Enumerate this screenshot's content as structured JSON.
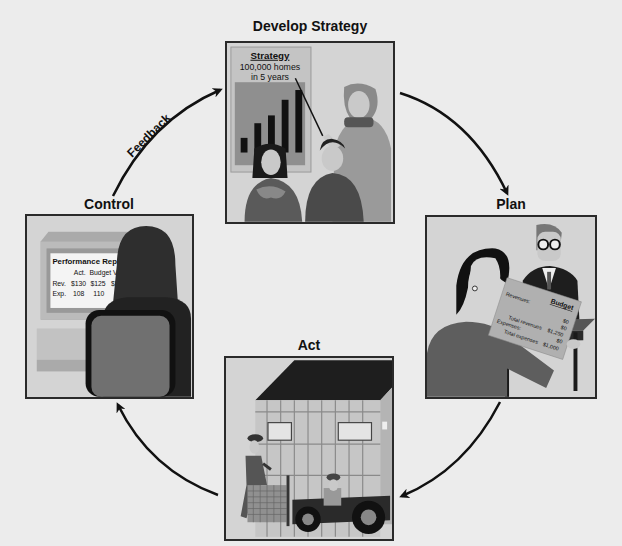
{
  "diagram": {
    "type": "cycle",
    "background_color": "#ececec",
    "stages": [
      {
        "id": "develop-strategy",
        "label": "Develop Strategy"
      },
      {
        "id": "plan",
        "label": "Plan"
      },
      {
        "id": "act",
        "label": "Act"
      },
      {
        "id": "control",
        "label": "Control"
      }
    ],
    "arrows": [
      {
        "from": "develop-strategy",
        "to": "plan",
        "label": ""
      },
      {
        "from": "plan",
        "to": "act",
        "label": ""
      },
      {
        "from": "act",
        "to": "control",
        "label": ""
      },
      {
        "from": "control",
        "to": "develop-strategy",
        "label": "Feedback"
      }
    ]
  },
  "develop_strategy_panel": {
    "board_title": "Strategy",
    "board_line1": "100,000 homes",
    "board_line2": "in 5 years",
    "bar_chart_heights": [
      1,
      2,
      3,
      4,
      5
    ]
  },
  "plan_panel": {
    "document_title": "Budget",
    "rows": [
      {
        "label": "Revenues:",
        "value": "$0"
      },
      {
        "label": "",
        "value": "$0"
      },
      {
        "label": "Total revenues",
        "value": "$1,250"
      },
      {
        "label": "Expenses:",
        "value": "$0"
      },
      {
        "label": "Total expenses",
        "value": "$1,000"
      }
    ]
  },
  "control_panel": {
    "report_title": "Performance Report",
    "columns": [
      "",
      "Act.",
      "Budget",
      "Var."
    ],
    "rows": [
      [
        "Rev.",
        "$130",
        "$125",
        "$5 F"
      ],
      [
        "Exp.",
        "108",
        "110",
        ""
      ]
    ]
  },
  "labels": {
    "develop_strategy": "Develop Strategy",
    "plan": "Plan",
    "act": "Act",
    "control": "Control",
    "feedback": "Feedback"
  }
}
